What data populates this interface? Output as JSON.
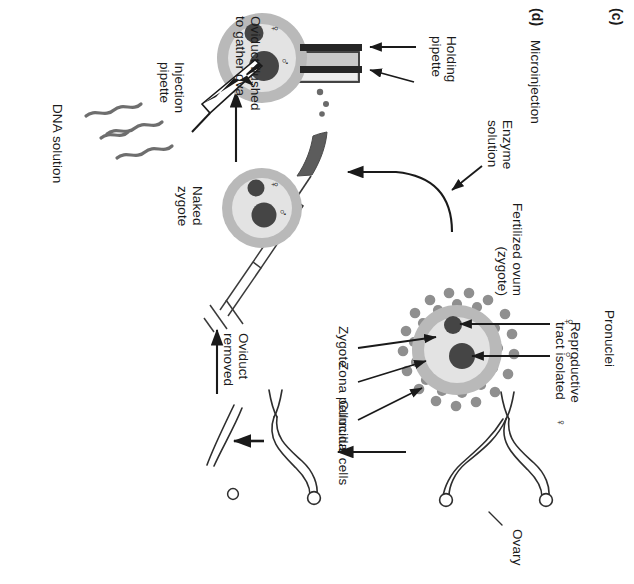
{
  "figure": {
    "panels": [
      {
        "tag": "(c)",
        "label": ""
      },
      {
        "tag": "(d)",
        "label": "Microinjection"
      }
    ]
  },
  "panel_c": {
    "tag": "(c)",
    "steps": [
      {
        "id": "reproductive-tract",
        "label": "Reproductive\ntract isolated"
      },
      {
        "id": "ovary",
        "label": "Ovary"
      },
      {
        "id": "female-symbol",
        "label": "♀"
      },
      {
        "id": "oviduct-removed",
        "label": "Oviduct\nremoved"
      },
      {
        "id": "oviduct-flushed",
        "label": "Oviduct flushed\nto gather ova"
      },
      {
        "id": "fertilized-ovum",
        "label": "Fertilized ovum\n(zygote)"
      },
      {
        "id": "enzyme-solution",
        "label": "Enzyme\nsolution"
      },
      {
        "id": "naked-zygote",
        "label": "Naked\nzygote"
      }
    ],
    "zygote_callouts": [
      {
        "id": "pronuclei",
        "label": "Pronuclei"
      },
      {
        "id": "zygote",
        "label": "Zygote"
      },
      {
        "id": "zona-pellucida",
        "label": "Zona pellucida"
      },
      {
        "id": "cumulus-cells",
        "label": "Cumulus cells"
      }
    ],
    "pronuclei_symbols": {
      "female": "♀",
      "male": "♂"
    }
  },
  "panel_d": {
    "tag": "(d)",
    "title": "Microinjection",
    "callouts": [
      {
        "id": "holding-pipette",
        "label": "Holding\npipette"
      },
      {
        "id": "injection-pipette",
        "label": "Injection\npipette"
      },
      {
        "id": "dna-solution",
        "label": "DNA solution"
      }
    ],
    "pronuclei_symbols": {
      "female": "♀",
      "male": "♂"
    }
  },
  "colors": {
    "ink": "#1a1a1a",
    "stroke": "#3a3a3a",
    "zona": "#b9b9b9",
    "cytoplasm": "#e3e3e3",
    "pronucleus": "#454545",
    "cumulus": "#8f8f8f",
    "dish_fill": "#c9c9c9",
    "dish_highlight": "#ededed",
    "oviduct_dark": "#5c5c5c",
    "dna": "#6e6e6e",
    "pipette": "#262626",
    "background": "#ffffff"
  }
}
